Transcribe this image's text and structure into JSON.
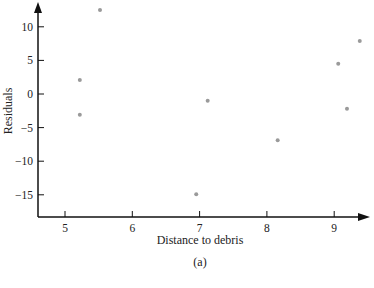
{
  "chart_data": {
    "type": "scatter",
    "title": "",
    "caption": "(a)",
    "xlabel": "Distance to debris",
    "ylabel": "Residuals",
    "xlim": [
      4.6,
      9.9
    ],
    "ylim": [
      -18.5,
      14
    ],
    "xticks": [
      5,
      6,
      7,
      8,
      9
    ],
    "yticks": [
      10,
      5,
      0,
      -5,
      -10,
      -15
    ],
    "xtick_labels": [
      "5",
      "6",
      "7",
      "8",
      "9"
    ],
    "ytick_labels": [
      "10",
      "5",
      "0",
      "−5",
      "−10",
      "−15"
    ],
    "grid": false,
    "legend": null,
    "points_color": "#9a9a9a",
    "axis_color": "#111111",
    "series": [
      {
        "name": "residuals",
        "points": [
          {
            "x": 5.52,
            "y": 12.5
          },
          {
            "x": 5.22,
            "y": 2.1
          },
          {
            "x": 5.22,
            "y": -3.1
          },
          {
            "x": 7.12,
            "y": -1.0
          },
          {
            "x": 6.95,
            "y": -14.9
          },
          {
            "x": 8.16,
            "y": -6.9
          },
          {
            "x": 9.06,
            "y": 4.5
          },
          {
            "x": 9.38,
            "y": 7.9
          },
          {
            "x": 9.19,
            "y": -2.2
          }
        ]
      }
    ]
  }
}
